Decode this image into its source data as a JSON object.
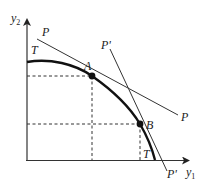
{
  "diagram": {
    "type": "production-possibility-frontier",
    "axes": {
      "y_label": "y",
      "y_subscript": "2",
      "x_label": "y",
      "x_subscript": "1"
    },
    "curve": {
      "name": "T",
      "label_top": "T",
      "label_bottom": "T"
    },
    "lines": [
      {
        "name": "P",
        "label_start": "P",
        "label_end": "P",
        "tangent_point": "A"
      },
      {
        "name": "P'",
        "label_start": "P'",
        "label_end": "P'",
        "tangent_point": "B"
      }
    ],
    "points": [
      {
        "name": "A",
        "label": "A"
      },
      {
        "name": "B",
        "label": "B"
      }
    ],
    "colors": {
      "line": "#222222",
      "curve": "#111111",
      "dash": "#333333",
      "background": "#ffffff"
    }
  }
}
